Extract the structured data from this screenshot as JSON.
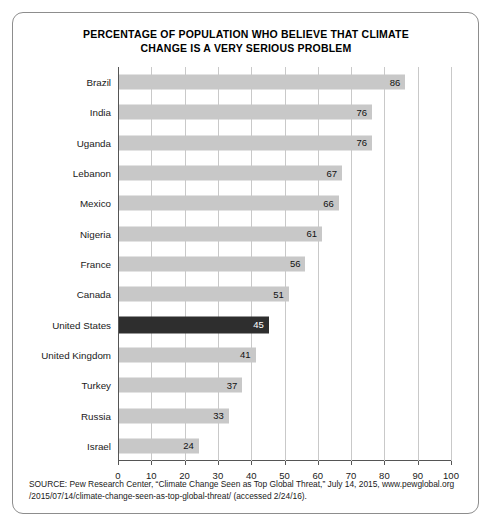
{
  "chart_data": {
    "type": "bar",
    "orientation": "horizontal",
    "title": "PERCENTAGE OF POPULATION WHO BELIEVE THAT CLIMATE CHANGE IS A VERY SERIOUS PROBLEM",
    "title_line1": "PERCENTAGE OF POPULATION WHO BELIEVE THAT CLIMATE",
    "title_line2": "CHANGE IS A VERY SERIOUS PROBLEM",
    "xlabel": "",
    "ylabel": "",
    "xlim": [
      0,
      100
    ],
    "grid": "vertical",
    "legend": "none",
    "categories": [
      "Brazil",
      "India",
      "Uganda",
      "Lebanon",
      "Mexico",
      "Nigeria",
      "France",
      "Canada",
      "United States",
      "United Kingdom",
      "Turkey",
      "Russia",
      "Israel"
    ],
    "values": [
      86,
      76,
      76,
      67,
      66,
      61,
      56,
      51,
      45,
      41,
      37,
      33,
      24
    ],
    "highlight_category": "United States",
    "bars": [
      {
        "label": "Brazil",
        "value": 86,
        "highlight": false
      },
      {
        "label": "India",
        "value": 76,
        "highlight": false
      },
      {
        "label": "Uganda",
        "value": 76,
        "highlight": false
      },
      {
        "label": "Lebanon",
        "value": 67,
        "highlight": false
      },
      {
        "label": "Mexico",
        "value": 66,
        "highlight": false
      },
      {
        "label": "Nigeria",
        "value": 61,
        "highlight": false
      },
      {
        "label": "France",
        "value": 56,
        "highlight": false
      },
      {
        "label": "Canada",
        "value": 51,
        "highlight": false
      },
      {
        "label": "United States",
        "value": 45,
        "highlight": true
      },
      {
        "label": "United Kingdom",
        "value": 41,
        "highlight": false
      },
      {
        "label": "Turkey",
        "value": 37,
        "highlight": false
      },
      {
        "label": "Russia",
        "value": 33,
        "highlight": false
      },
      {
        "label": "Israel",
        "value": 24,
        "highlight": false
      }
    ],
    "xticks": [
      0,
      10,
      20,
      30,
      40,
      50,
      60,
      70,
      80,
      90,
      100
    ],
    "colors": {
      "bar": "#c8c8c8",
      "bar_highlight": "#2e2e2e",
      "grid": "#c9c9c9",
      "axis": "#555555",
      "frame": "#8d8d8d",
      "text": "#111111",
      "highlight_value_text": "#ffffff"
    }
  },
  "source": {
    "line1": "SOURCE: Pew Research Center, “Climate Change Seen as Top Global Threat,” July 14, 2015, www.pewglobal.org",
    "line2": "/2015/07/14/climate-change-seen-as-top-global-threat/ (accessed 2/24/16)."
  }
}
